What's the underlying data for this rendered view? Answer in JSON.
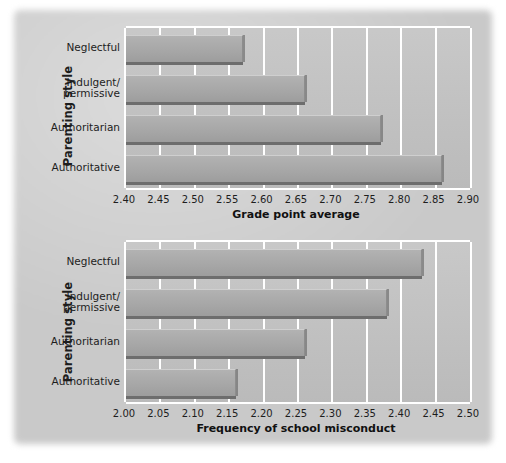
{
  "figure": {
    "category_axis_title": "Parenting style",
    "categories": [
      "Neglectful",
      "Indulgent/\npermissive",
      "Authoritarian",
      "Authoritative"
    ],
    "bar_color": "#a8a8a8",
    "plot_background": "#c2c2c2",
    "gridline_color": "#ffffff",
    "text_color": "#1d1d1d"
  },
  "chart_data": [
    {
      "type": "bar",
      "orientation": "horizontal",
      "title": "",
      "xlabel": "Grade point average",
      "ylabel": "Parenting style",
      "categories": [
        "Neglectful",
        "Indulgent/permissive",
        "Authoritarian",
        "Authoritative"
      ],
      "values": [
        2.57,
        2.66,
        2.77,
        2.86
      ],
      "xlim": [
        2.4,
        2.9
      ],
      "xticks": [
        2.4,
        2.45,
        2.5,
        2.55,
        2.6,
        2.65,
        2.7,
        2.75,
        2.8,
        2.85,
        2.9
      ],
      "xtick_labels": [
        "2.40",
        "2.45",
        "2.50",
        "2.55",
        "2.60",
        "2.65",
        "2.70",
        "2.75",
        "2.80",
        "2.85",
        "2.90"
      ],
      "grid": true,
      "legend": false
    },
    {
      "type": "bar",
      "orientation": "horizontal",
      "title": "",
      "xlabel": "Frequency of school misconduct",
      "ylabel": "Parenting style",
      "categories": [
        "Neglectful",
        "Indulgent/permissive",
        "Authoritarian",
        "Authoritative"
      ],
      "values": [
        2.43,
        2.38,
        2.26,
        2.16
      ],
      "xlim": [
        2.0,
        2.5
      ],
      "xticks": [
        2.0,
        2.05,
        2.1,
        2.15,
        2.2,
        2.25,
        2.3,
        2.35,
        2.4,
        2.45,
        2.5
      ],
      "xtick_labels": [
        "2.00",
        "2.05",
        "2.10",
        "2.15",
        "2.20",
        "2.25",
        "2.30",
        "2.35",
        "2.40",
        "2.45",
        "2.50"
      ],
      "grid": true,
      "legend": false
    }
  ]
}
